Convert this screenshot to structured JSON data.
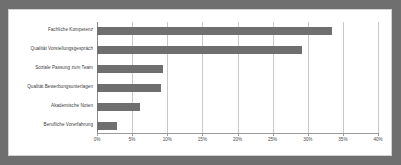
{
  "chart_data": {
    "type": "bar",
    "orientation": "horizontal",
    "title": "",
    "subtitle": "",
    "xlabel": "",
    "ylabel": "",
    "categories": [
      "Fachliche Kompetenz",
      "Qualität Vorstellungsgespräch",
      "Soziale Passung zum Team",
      "Qualität Bewerbungsunterlagen",
      "Akademische Noten",
      "Berufliche Vorerfahrung"
    ],
    "values": [
      33.5,
      29.2,
      9.4,
      9.1,
      6.1,
      2.8
    ],
    "value_unit": "%",
    "xlim": [
      0,
      40
    ],
    "xticks": [
      0,
      5,
      10,
      15,
      20,
      25,
      30,
      35,
      40
    ],
    "xtick_labels": [
      "0%",
      "5%",
      "10%",
      "15%",
      "20%",
      "25%",
      "30%",
      "35%",
      "40%"
    ],
    "grid": true,
    "grid_axis": "x",
    "legend": false,
    "legend_position": "none",
    "bar_color": "#6f6f6f",
    "grid_color": "#c8c8c8",
    "axis_color": "#8a8a8a",
    "frame_color": "#d2d2d2",
    "background": "#ffffff"
  }
}
